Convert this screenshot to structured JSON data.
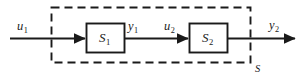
{
  "diagram": {
    "canvas": {
      "width": 307,
      "height": 79,
      "background": "#ffffff"
    },
    "stroke_color": "#1a1a1a",
    "blocks": [
      {
        "id": "s1",
        "name": "S1",
        "label_main": "S",
        "label_sub": "1",
        "x": 86,
        "y": 23,
        "width": 39,
        "height": 30
      },
      {
        "id": "s2",
        "name": "S2",
        "label_main": "S",
        "label_sub": "2",
        "x": 189,
        "y": 23,
        "width": 39,
        "height": 30
      }
    ],
    "signals": [
      {
        "id": "u1",
        "label_main": "u",
        "label_sub": "1"
      },
      {
        "id": "y1",
        "label_main": "y",
        "label_sub": "1"
      },
      {
        "id": "u2",
        "label_main": "u",
        "label_sub": "2"
      },
      {
        "id": "y2",
        "label_main": "y",
        "label_sub": "2"
      }
    ],
    "enclosure": {
      "id": "S",
      "label": "S",
      "x": 51,
      "y": 7,
      "width": 200,
      "height": 56,
      "dash": "8 5",
      "label_position": "bottom-right-outside"
    }
  }
}
